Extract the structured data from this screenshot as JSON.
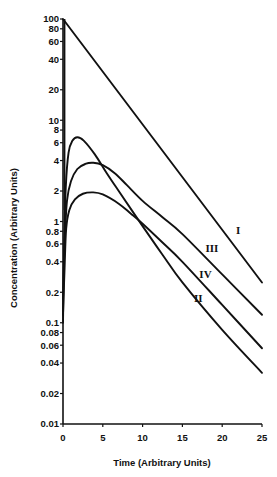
{
  "chart_data": {
    "type": "line",
    "title": "",
    "xlabel": "Time (Arbitrary Units)",
    "ylabel": "Concentration (Arbitrary Units)",
    "xscale": "linear",
    "yscale": "log",
    "xlim": [
      0,
      25
    ],
    "ylim": [
      0.01,
      100
    ],
    "grid": false,
    "legend": "none (curves labeled inline with Roman numerals)",
    "x_ticks": [
      0,
      5,
      10,
      15,
      20,
      25
    ],
    "x_tick_labels": [
      "0",
      "5",
      "10",
      "15",
      "20",
      "25"
    ],
    "y_ticks": [
      100,
      80,
      60,
      40,
      20,
      10,
      8,
      6,
      4,
      2,
      1,
      0.8,
      0.6,
      0.4,
      0.2,
      0.1,
      0.08,
      0.06,
      0.04,
      0.02,
      0.01
    ],
    "y_tick_labels": [
      "100",
      "80",
      "60",
      "40",
      "20",
      "10",
      "8",
      "6",
      "4",
      "2",
      "1",
      "0.8",
      "0.6",
      "0.4",
      "0.2",
      "0.1",
      "0.08",
      "0.06",
      "0.04",
      "0.02",
      "0.01"
    ],
    "series": [
      {
        "name": "I",
        "points": [
          [
            0,
            100
          ],
          [
            25,
            0.25
          ]
        ],
        "label_pos": [
          22.0,
          0.75
        ]
      },
      {
        "name": "II",
        "points": [
          [
            0,
            0.1
          ],
          [
            0.15,
            0.6
          ],
          [
            0.35,
            2.2
          ],
          [
            0.7,
            4.8
          ],
          [
            1.2,
            6.3
          ],
          [
            1.8,
            6.8
          ],
          [
            2.6,
            6.3
          ],
          [
            4,
            4.6
          ],
          [
            5.5,
            3.0
          ],
          [
            7,
            2.0
          ],
          [
            10,
            0.9
          ],
          [
            12.5,
            0.47
          ],
          [
            15,
            0.25
          ],
          [
            20,
            0.085
          ],
          [
            25,
            0.032
          ]
        ],
        "label_pos": [
          17.0,
          0.16
        ]
      },
      {
        "name": "III",
        "points": [
          [
            0,
            0.17
          ],
          [
            0.2,
            0.6
          ],
          [
            0.5,
            1.6
          ],
          [
            1,
            2.5
          ],
          [
            1.8,
            3.3
          ],
          [
            2.8,
            3.7
          ],
          [
            3.8,
            3.8
          ],
          [
            5,
            3.6
          ],
          [
            6.5,
            3.0
          ],
          [
            8,
            2.3
          ],
          [
            10,
            1.6
          ],
          [
            12.5,
            1.1
          ],
          [
            15,
            0.75
          ],
          [
            20,
            0.3
          ],
          [
            25,
            0.12
          ]
        ],
        "label_pos": [
          18.7,
          0.5
        ]
      },
      {
        "name": "IV",
        "points": [
          [
            0,
            0.12
          ],
          [
            0.2,
            0.35
          ],
          [
            0.4,
            0.85
          ],
          [
            0.8,
            1.3
          ],
          [
            1.5,
            1.65
          ],
          [
            2.5,
            1.88
          ],
          [
            3.8,
            1.94
          ],
          [
            5,
            1.85
          ],
          [
            7,
            1.5
          ],
          [
            8.5,
            1.2
          ],
          [
            10,
            0.95
          ],
          [
            12.5,
            0.62
          ],
          [
            15,
            0.4
          ],
          [
            20,
            0.15
          ],
          [
            25,
            0.056
          ]
        ],
        "label_pos": [
          17.9,
          0.275
        ]
      }
    ],
    "annotations": [
      {
        "type": "vertical-segment",
        "x": 0,
        "y_from": 100,
        "y_to": 1.3
      }
    ]
  },
  "axes": {
    "x_title": "Time (Arbitrary Units)",
    "y_title": "Concentration (Arbitrary Units)"
  }
}
